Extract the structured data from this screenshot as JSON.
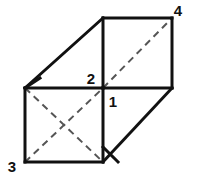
{
  "figure": {
    "kind": "geometry-diagram",
    "background_color": "#ffffff",
    "stroke_color": "#111111",
    "dash_color": "#555555",
    "solid_stroke_width": 3,
    "dash_stroke_width": 2,
    "dash_pattern": "7 5",
    "canvas": {
      "width": 197,
      "height": 177
    },
    "vertices": {
      "front_top_left": {
        "x": 25,
        "y": 88
      },
      "front_top_right": {
        "x": 103,
        "y": 88
      },
      "front_bottom_left": {
        "x": 25,
        "y": 162
      },
      "front_bottom_right": {
        "x": 103,
        "y": 162
      },
      "back_top_left": {
        "x": 103,
        "y": 18
      },
      "back_top_right": {
        "x": 172,
        "y": 18
      },
      "back_bottom_right": {
        "x": 172,
        "y": 88
      }
    },
    "solid_edges": [
      {
        "name": "front-face-top",
        "x1": 25,
        "y1": 88,
        "x2": 103,
        "y2": 88
      },
      {
        "name": "front-face-left",
        "x1": 25,
        "y1": 88,
        "x2": 25,
        "y2": 162
      },
      {
        "name": "front-face-bottom",
        "x1": 25,
        "y1": 162,
        "x2": 103,
        "y2": 162
      },
      {
        "name": "front-face-right",
        "x1": 103,
        "y1": 88,
        "x2": 103,
        "y2": 162
      },
      {
        "name": "top-face-left-slant",
        "x1": 25,
        "y1": 88,
        "x2": 103,
        "y2": 18
      },
      {
        "name": "top-face-back-edge",
        "x1": 103,
        "y1": 18,
        "x2": 172,
        "y2": 18
      },
      {
        "name": "back-face-left",
        "x1": 103,
        "y1": 18,
        "x2": 103,
        "y2": 88
      },
      {
        "name": "back-face-right",
        "x1": 172,
        "y1": 18,
        "x2": 172,
        "y2": 88
      },
      {
        "name": "side-face-top-edge",
        "x1": 103,
        "y1": 88,
        "x2": 172,
        "y2": 88
      },
      {
        "name": "side-face-slant",
        "x1": 172,
        "y1": 88,
        "x2": 103,
        "y2": 162
      }
    ],
    "solid_short_marks": [
      {
        "name": "corner-mark-front-top-left",
        "x1": 25,
        "y1": 88,
        "x2": 40,
        "y2": 78
      },
      {
        "name": "corner-mark-front-bottom-right",
        "x1": 103,
        "y1": 147,
        "x2": 118,
        "y2": 162
      }
    ],
    "dashed_edges": [
      {
        "name": "back-face-diagonal",
        "x1": 103,
        "y1": 88,
        "x2": 172,
        "y2": 18
      },
      {
        "name": "front-face-diagonal-up",
        "x1": 25,
        "y1": 162,
        "x2": 103,
        "y2": 88
      },
      {
        "name": "front-face-diagonal-down",
        "x1": 25,
        "y1": 88,
        "x2": 103,
        "y2": 162
      }
    ],
    "labels": [
      {
        "id": "label-4",
        "text": "4",
        "x": 178,
        "y": 16,
        "anchor": "middle"
      },
      {
        "id": "label-2",
        "text": "2",
        "x": 91,
        "y": 84,
        "anchor": "middle"
      },
      {
        "id": "label-1",
        "text": "1",
        "x": 113,
        "y": 107,
        "anchor": "middle"
      },
      {
        "id": "label-3",
        "text": "3",
        "x": 12,
        "y": 172,
        "anchor": "middle"
      }
    ]
  }
}
